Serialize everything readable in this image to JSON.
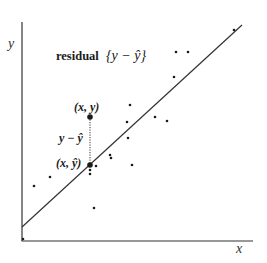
{
  "diagram": {
    "type": "scatter-with-regression",
    "axes": {
      "x_label": "x",
      "y_label": "y"
    },
    "title_label": "residual",
    "title_formula": "{y − ŷ}",
    "point_label": "(x, y)",
    "fitted_label": "(x, ŷ)",
    "residual_label": "y − ŷ",
    "colors": {
      "ink": "#1a1a1a",
      "axis": "#333333",
      "background": "#ffffff"
    },
    "regression_line": {
      "x1": 22,
      "y1": 227,
      "x2": 242,
      "y2": 25
    },
    "highlight": {
      "observed": {
        "x": 90,
        "y": 117
      },
      "fitted": {
        "x": 90,
        "y": 165
      }
    },
    "points": [
      {
        "x": 234,
        "y": 30
      },
      {
        "x": 176,
        "y": 52
      },
      {
        "x": 188,
        "y": 52
      },
      {
        "x": 174,
        "y": 77
      },
      {
        "x": 130,
        "y": 105
      },
      {
        "x": 127,
        "y": 122
      },
      {
        "x": 155,
        "y": 117
      },
      {
        "x": 167,
        "y": 121
      },
      {
        "x": 128,
        "y": 138
      },
      {
        "x": 110,
        "y": 155
      },
      {
        "x": 111,
        "y": 158
      },
      {
        "x": 96,
        "y": 166
      },
      {
        "x": 90,
        "y": 170
      },
      {
        "x": 90,
        "y": 174
      },
      {
        "x": 132,
        "y": 165
      },
      {
        "x": 50,
        "y": 177
      },
      {
        "x": 34,
        "y": 186
      },
      {
        "x": 94,
        "y": 208
      },
      {
        "x": 23,
        "y": 239
      }
    ]
  }
}
